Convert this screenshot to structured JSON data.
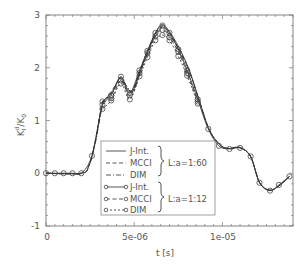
{
  "chart_data": {
    "type": "line",
    "title": "",
    "xlabel": "t [s]",
    "ylabel": "K_I^d/K_0",
    "xlim": [
      0,
      1.4e-05
    ],
    "ylim": [
      -1,
      3
    ],
    "xticks": [
      0,
      5e-06,
      1e-05
    ],
    "xtick_labels": [
      "0",
      "5e-06",
      "1e-05"
    ],
    "yticks": [
      -1,
      0,
      1,
      2,
      3
    ],
    "ytick_labels": [
      "-1",
      "0",
      "1",
      "2",
      "3"
    ],
    "grid": false,
    "legend_position": "lower center",
    "legend_groups": [
      {
        "label": "L:a=1:60",
        "entries": [
          "J-Int.",
          "MCCI",
          "DIM"
        ]
      },
      {
        "label": "L:a=1:12",
        "entries": [
          "J-Int.",
          "MCCI",
          "DIM"
        ]
      }
    ],
    "series": [
      {
        "name": "J-Int. (L:a=1:60)",
        "style": "solid",
        "marker": "none",
        "x": [
          0,
          2e-06,
          2.44e-06,
          2.8e-06,
          3.18e-06,
          3.47e-06,
          3.8e-06,
          4.2e-06,
          4.6e-06,
          4.94e-06,
          5.4e-06,
          5.85e-06,
          6.25e-06,
          6.59e-06,
          6.99e-06,
          7.56e-06,
          8.13e-06,
          8.69e-06,
          9.26e-06,
          9.89e-06,
          1.04e-05,
          1.097e-05,
          1.159e-05,
          1.21e-05,
          1.267e-05,
          1.324e-05,
          1.38e-05
        ],
        "y": [
          0,
          0,
          0.15,
          0.6,
          1.29,
          1.44,
          1.57,
          1.8,
          1.61,
          1.57,
          1.99,
          2.37,
          2.69,
          2.82,
          2.69,
          2.37,
          1.95,
          1.38,
          0.82,
          0.53,
          0.47,
          0.49,
          0.32,
          -0.17,
          -0.32,
          -0.23,
          -0.06
        ]
      },
      {
        "name": "MCCI (L:a=1:60)",
        "style": "dashed",
        "marker": "none",
        "x": [
          0,
          2e-06,
          2.44e-06,
          2.8e-06,
          3.18e-06,
          3.47e-06,
          3.8e-06,
          4.2e-06,
          4.6e-06,
          4.94e-06,
          5.4e-06,
          5.85e-06,
          6.25e-06,
          6.59e-06,
          6.99e-06,
          7.56e-06,
          8.13e-06,
          8.69e-06,
          9.26e-06,
          9.89e-06,
          1.04e-05,
          1.097e-05,
          1.159e-05,
          1.21e-05,
          1.267e-05,
          1.324e-05,
          1.38e-05
        ],
        "y": [
          0,
          0,
          0.15,
          0.62,
          1.33,
          1.4,
          1.6,
          1.76,
          1.58,
          1.6,
          2.02,
          2.4,
          2.66,
          2.78,
          2.66,
          2.34,
          1.93,
          1.37,
          0.82,
          0.53,
          0.47,
          0.49,
          0.32,
          -0.17,
          -0.32,
          -0.23,
          -0.06
        ]
      },
      {
        "name": "DIM (L:a=1:60)",
        "style": "dashdot",
        "marker": "none",
        "x": [
          0,
          2e-06,
          2.44e-06,
          2.8e-06,
          3.18e-06,
          3.47e-06,
          3.8e-06,
          4.2e-06,
          4.6e-06,
          4.94e-06,
          5.4e-06,
          5.85e-06,
          6.25e-06,
          6.59e-06,
          6.99e-06,
          7.56e-06,
          8.13e-06,
          8.69e-06,
          9.26e-06,
          9.89e-06,
          1.04e-05,
          1.097e-05,
          1.159e-05,
          1.21e-05,
          1.267e-05,
          1.324e-05,
          1.38e-05
        ],
        "y": [
          0,
          0,
          0.15,
          0.58,
          1.25,
          1.46,
          1.54,
          1.82,
          1.64,
          1.54,
          1.96,
          2.33,
          2.63,
          2.75,
          2.63,
          2.32,
          1.92,
          1.37,
          0.82,
          0.53,
          0.47,
          0.49,
          0.32,
          -0.17,
          -0.32,
          -0.23,
          -0.06
        ]
      },
      {
        "name": "J-Int. (L:a=1:12)",
        "style": "solid",
        "marker": "circle",
        "x": [
          0,
          5e-07,
          1e-06,
          1.5e-06,
          2e-06,
          2.6e-06,
          3.2e-06,
          3.7e-06,
          4.25e-06,
          4.75e-06,
          5.3e-06,
          5.75e-06,
          6.2e-06,
          6.6e-06,
          7e-06,
          7.5e-06,
          8e-06,
          8.6e-06,
          9.2e-06,
          9.8e-06,
          1.04e-05,
          1.1e-05,
          1.16e-05,
          1.21e-05,
          1.27e-05,
          1.32e-05,
          1.38e-05
        ],
        "y": [
          0,
          0,
          0,
          0,
          0,
          0.33,
          1.3,
          1.48,
          1.83,
          1.52,
          1.95,
          2.32,
          2.66,
          2.8,
          2.66,
          2.35,
          1.95,
          1.4,
          0.84,
          0.52,
          0.46,
          0.48,
          0.32,
          -0.18,
          -0.33,
          -0.22,
          -0.06
        ]
      },
      {
        "name": "MCCI (L:a=1:12)",
        "style": "dashed",
        "marker": "circle",
        "x": [
          3.2e-06,
          3.7e-06,
          4.25e-06,
          4.75e-06,
          5.3e-06,
          5.75e-06,
          6.2e-06,
          6.6e-06,
          7e-06,
          7.5e-06,
          8e-06,
          8.6e-06
        ],
        "y": [
          1.36,
          1.42,
          1.76,
          1.48,
          1.9,
          2.28,
          2.6,
          2.72,
          2.58,
          2.3,
          1.9,
          1.36
        ]
      },
      {
        "name": "DIM (L:a=1:12)",
        "style": "dotted",
        "marker": "circle",
        "x": [
          3.2e-06,
          3.7e-06,
          4.25e-06,
          4.75e-06,
          5.3e-06,
          5.75e-06,
          6.2e-06,
          6.6e-06,
          7e-06,
          7.5e-06,
          8e-06,
          8.6e-06
        ],
        "y": [
          1.22,
          1.38,
          1.7,
          1.4,
          1.84,
          2.2,
          2.52,
          2.62,
          2.52,
          2.22,
          1.85,
          1.32
        ]
      }
    ]
  },
  "axes": {
    "xlabel": "t [s]",
    "ylabel_main": "K",
    "ylabel_sub": "I",
    "ylabel_sup": "d",
    "ylabel_den": "/K",
    "ylabel_den_sub": "0",
    "xtick_labels": [
      "0",
      "5e-06",
      "1e-05"
    ],
    "ytick_labels": [
      "3",
      "2",
      "1",
      "0",
      "-1"
    ]
  },
  "legend": {
    "group1_entries": [
      "J-Int.",
      "MCCI",
      "DIM"
    ],
    "group1_label": "L:a=1:60",
    "group2_entries": [
      "J-Int.",
      "MCCI",
      "DIM"
    ],
    "group2_label": "L:a=1:12"
  }
}
